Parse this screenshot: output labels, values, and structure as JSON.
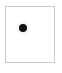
{
  "panel": {
    "name": "dot-marker-tile",
    "label": "",
    "background_color": "#ffffff",
    "border_color": "#c9c9c9",
    "border_width_px": 1,
    "left_px": 5,
    "top_px": 6,
    "width_px": 50,
    "height_px": 57
  },
  "marker": {
    "icon": "filled-circle-dot-icon",
    "label": "",
    "color": "#101010",
    "diameter_px": 8,
    "center_x_px": 23,
    "center_y_px": 28,
    "shape": "circle",
    "filled": true
  },
  "canvas": {
    "width_px": 62,
    "height_px": 73,
    "background_color": "#ffffff"
  }
}
